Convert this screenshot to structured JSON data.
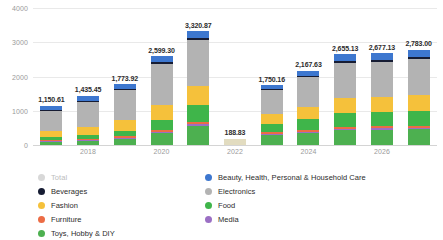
{
  "chart_data": {
    "type": "bar",
    "stacked": true,
    "title": "",
    "xlabel": "",
    "ylabel": "",
    "ylim": [
      0,
      4000
    ],
    "yticks": [
      0,
      1000,
      2000,
      3000,
      4000
    ],
    "ytick_labels": [
      "0",
      "1000",
      "2000",
      "3000",
      "4000"
    ],
    "grid": true,
    "legend_position": "bottom",
    "categories": [
      "2017",
      "2018",
      "2019",
      "2020",
      "2021",
      "2022",
      "2023",
      "2024",
      "2025",
      "2026",
      "2027"
    ],
    "xtick_labels": [
      "",
      "2018",
      "",
      "2020",
      "",
      "2022",
      "",
      "2024",
      "",
      "2026",
      ""
    ],
    "totals": [
      1150.61,
      1435.45,
      1773.92,
      2599.3,
      3320.87,
      188.83,
      1750.16,
      2167.63,
      2655.13,
      2677.13,
      2783.0
    ],
    "total_labels": [
      "1,150.61",
      "1,435.45",
      "1,773.92",
      "2,599.30",
      "3,320.87",
      "188.83",
      "1,750.16",
      "2,167.63",
      "2,655.13",
      "2,677.13",
      "2,783.00"
    ],
    "series": [
      {
        "name": "Toys, Hobby & DIY",
        "color": "#4db050",
        "values": [
          86,
          118,
          180,
          345,
          560,
          0,
          300,
          360,
          440,
          450,
          470
        ]
      },
      {
        "name": "Media",
        "color": "#9b6fc4",
        "values": [
          22,
          26,
          30,
          36,
          42,
          0,
          26,
          30,
          34,
          35,
          36
        ]
      },
      {
        "name": "Furniture",
        "color": "#ec6c45",
        "values": [
          30,
          36,
          44,
          58,
          72,
          0,
          42,
          50,
          58,
          60,
          62
        ]
      },
      {
        "name": "Food",
        "color": "#3fb54a",
        "values": [
          95,
          120,
          165,
          300,
          500,
          0,
          250,
          320,
          400,
          410,
          430
        ]
      },
      {
        "name": "Fashion",
        "color": "#f5c13b",
        "values": [
          175,
          235,
          300,
          440,
          560,
          0,
          295,
          360,
          450,
          455,
          470
        ]
      },
      {
        "name": "Electronics",
        "color": "#b3b3b3",
        "values": [
          590,
          720,
          880,
          1180,
          1320,
          0,
          700,
          855,
          1010,
          1020,
          1055
        ]
      },
      {
        "name": "Beverages",
        "color": "#161c33",
        "values": [
          22,
          28,
          35,
          55,
          76,
          0,
          37,
          42,
          58,
          57,
          60
        ]
      },
      {
        "name": "Beauty, Health, Personal & Household Care",
        "color": "#3d77cf",
        "values": [
          130,
          152,
          140,
          185,
          191,
          0,
          100,
          151,
          205,
          190,
          200
        ]
      },
      {
        "name": "Total",
        "color": "#e2dcc0",
        "values": [
          0,
          0,
          0,
          0,
          0,
          188.83,
          0,
          0,
          0,
          0,
          0
        ]
      }
    ],
    "legend": {
      "left_column": [
        {
          "label": "Total",
          "color": "#d8d8d8",
          "muted": true
        },
        {
          "label": "Beverages",
          "color": "#161c33",
          "muted": false
        },
        {
          "label": "Fashion",
          "color": "#f5c13b",
          "muted": false
        },
        {
          "label": "Furniture",
          "color": "#ec6c45",
          "muted": false
        },
        {
          "label": "Toys, Hobby & DIY",
          "color": "#4db050",
          "muted": false
        }
      ],
      "right_column": [
        {
          "label": "Beauty, Health, Personal & Household Care",
          "color": "#3d77cf",
          "muted": false
        },
        {
          "label": "Electronics",
          "color": "#b3b3b3",
          "muted": false
        },
        {
          "label": "Food",
          "color": "#3fb54a",
          "muted": false
        },
        {
          "label": "Media",
          "color": "#9b6fc4",
          "muted": false
        }
      ]
    }
  }
}
